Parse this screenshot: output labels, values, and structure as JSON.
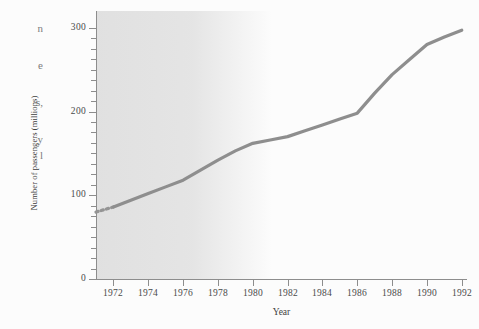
{
  "page": {
    "background_color": "#fcfcfc",
    "margin_text_fragments": [
      "n",
      "e",
      "s,",
      "y",
      "l"
    ]
  },
  "chart_data": {
    "type": "line",
    "title": "",
    "xlabel": "Year",
    "ylabel": "Number of passengers (millions)",
    "xlim": [
      1971,
      1992.3
    ],
    "ylim": [
      0,
      320
    ],
    "grid": false,
    "legend": null,
    "series_color": "#8e8e8e",
    "plot_background_color": "#dedede",
    "axis_color": "#8d8d8d",
    "x": [
      1971,
      1972,
      1973,
      1974,
      1975,
      1976,
      1977,
      1978,
      1979,
      1980,
      1981,
      1982,
      1983,
      1984,
      1985,
      1986,
      1987,
      1988,
      1989,
      1990,
      1991,
      1992
    ],
    "values": [
      80,
      86,
      94,
      102,
      110,
      118,
      130,
      142,
      153,
      162,
      166,
      170,
      177,
      184,
      191,
      198,
      222,
      244,
      262,
      280,
      289,
      297
    ],
    "dashed_lead_in": {
      "from_x": 1971,
      "to_x": 1972,
      "from_y": 80,
      "to_y": 86
    },
    "y_ticks_major": [
      0,
      100,
      200,
      300
    ],
    "y_tick_labels": [
      "0",
      "100",
      "200",
      "300"
    ],
    "y_minor_tick_interval": 12.5,
    "x_ticks_major": [
      1972,
      1974,
      1976,
      1978,
      1980,
      1982,
      1984,
      1986,
      1988,
      1990,
      1992
    ],
    "x_tick_labels": [
      "1972",
      "1974",
      "1976",
      "1978",
      "1980",
      "1982",
      "1984",
      "1986",
      "1988",
      "1990",
      "1992"
    ]
  }
}
